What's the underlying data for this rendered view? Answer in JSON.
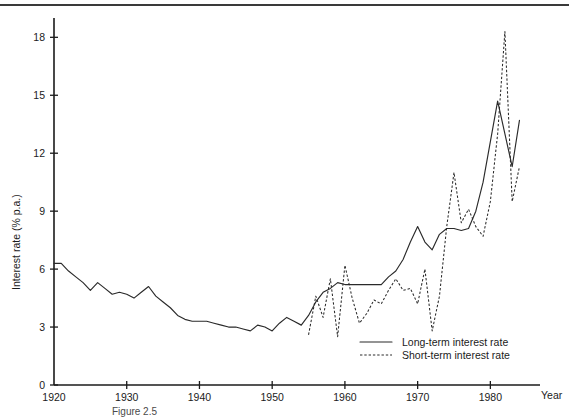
{
  "figure": {
    "caption": "Figure 2.5"
  },
  "chart_data": {
    "type": "line",
    "title": "",
    "xlabel": "Year",
    "ylabel": "Interest rate (% p.a.)",
    "xlim": [
      1920,
      1986
    ],
    "ylim": [
      0,
      19
    ],
    "grid": false,
    "legend_position": "bottom-right",
    "xticks": [
      1920,
      1930,
      1940,
      1950,
      1960,
      1970,
      1980
    ],
    "xtick_labels": [
      "1920",
      "1930",
      "1940",
      "1950",
      "1960",
      "1970",
      "1980"
    ],
    "yticks": [
      0,
      3,
      6,
      9,
      12,
      15,
      18
    ],
    "ytick_labels": [
      "0",
      "3",
      "6",
      "9",
      "12",
      "15",
      "18"
    ],
    "series": [
      {
        "name": "Long-term interest rate",
        "style": "solid",
        "x": [
          1920,
          1921,
          1922,
          1923,
          1924,
          1925,
          1926,
          1927,
          1928,
          1929,
          1930,
          1931,
          1932,
          1933,
          1934,
          1935,
          1936,
          1937,
          1938,
          1939,
          1940,
          1941,
          1942,
          1943,
          1944,
          1945,
          1946,
          1947,
          1948,
          1949,
          1950,
          1951,
          1952,
          1953,
          1954,
          1955,
          1956,
          1957,
          1958,
          1959,
          1960,
          1961,
          1962,
          1963,
          1964,
          1965,
          1966,
          1967,
          1968,
          1969,
          1970,
          1971,
          1972,
          1973,
          1974,
          1975,
          1976,
          1977,
          1978,
          1979,
          1980,
          1981,
          1982,
          1983,
          1984
        ],
        "values": [
          6.3,
          6.3,
          5.9,
          5.6,
          5.3,
          4.9,
          5.3,
          5.0,
          4.7,
          4.8,
          4.7,
          4.5,
          4.8,
          5.1,
          4.6,
          4.3,
          4.0,
          3.6,
          3.4,
          3.3,
          3.3,
          3.3,
          3.2,
          3.1,
          3.0,
          3.0,
          2.9,
          2.8,
          3.1,
          3.0,
          2.8,
          3.2,
          3.5,
          3.3,
          3.1,
          3.6,
          4.3,
          4.8,
          5.0,
          5.3,
          5.2,
          5.2,
          5.2,
          5.2,
          5.2,
          5.2,
          5.6,
          5.9,
          6.5,
          7.4,
          8.2,
          7.4,
          7.0,
          7.8,
          8.1,
          8.1,
          8.0,
          8.1,
          9.0,
          10.5,
          12.6,
          14.7,
          13.0,
          11.3,
          13.7
        ]
      },
      {
        "name": "Short-term interest rate",
        "style": "dashed",
        "x": [
          1955,
          1956,
          1957,
          1958,
          1959,
          1960,
          1961,
          1962,
          1963,
          1964,
          1965,
          1966,
          1967,
          1968,
          1969,
          1970,
          1971,
          1972,
          1973,
          1974,
          1975,
          1976,
          1977,
          1978,
          1979,
          1980,
          1981,
          1982,
          1983,
          1984
        ],
        "values": [
          2.6,
          4.6,
          3.5,
          5.5,
          2.5,
          6.2,
          4.5,
          3.2,
          3.7,
          4.4,
          4.2,
          4.9,
          5.5,
          4.9,
          5.0,
          4.2,
          6.0,
          2.8,
          4.6,
          8.2,
          11.0,
          8.4,
          9.1,
          8.2,
          7.7,
          9.5,
          13.0,
          18.3,
          9.5,
          11.3
        ]
      }
    ]
  },
  "legend": {
    "items": [
      {
        "label": "Long-term interest rate",
        "style": "solid"
      },
      {
        "label": "Short-term interest rate",
        "style": "dashed"
      }
    ]
  },
  "colors": {
    "ink": "#1b1b1b",
    "line": "#2a2a2a",
    "background": "#ffffff"
  }
}
